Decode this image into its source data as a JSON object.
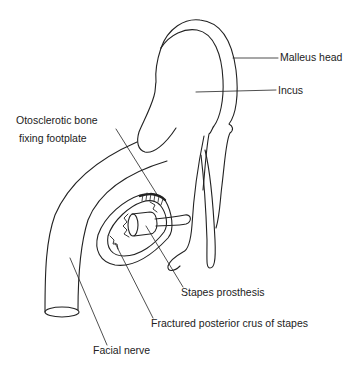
{
  "diagram": {
    "type": "anatomical-illustration",
    "stroke_color": "#222222",
    "background": "#ffffff",
    "labels": [
      {
        "id": "malleus-head",
        "text": "Malleus head"
      },
      {
        "id": "incus",
        "text": "Incus"
      },
      {
        "id": "otosclerotic-line1",
        "text": "Otosclerotic bone"
      },
      {
        "id": "otosclerotic-line2",
        "text": "fixing footplate"
      },
      {
        "id": "stapes-prosthesis",
        "text": "Stapes prosthesis"
      },
      {
        "id": "fractured-crus",
        "text": "Fractured posterior crus of stapes"
      },
      {
        "id": "facial-nerve",
        "text": "Facial nerve"
      }
    ]
  }
}
